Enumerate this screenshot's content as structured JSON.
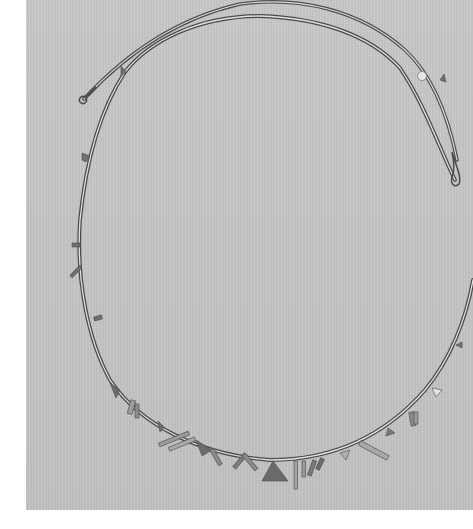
{
  "image": {
    "kind": "photograph",
    "subject": "necklace",
    "description": "Thin metal tubular-bead necklace laid in an open oval on a gray textured surface, with small triangular and bar-shaped pendant charms clustered along the lower curve; hook-and-loop clasp ends near the top left and top right.",
    "colors": {
      "background_margin": "#ffffff",
      "surface": "#c6c6c6",
      "metal": "#5a5a5a",
      "metal_highlight": "#e4e4e4",
      "charm_dark": "#6b6b6b",
      "charm_light": "#a8a8a8"
    },
    "elements": {
      "strand": "tubular bead strand",
      "clasp_left": "loop clasp end",
      "clasp_right": "hook clasp end",
      "bead_disc": "small round disc bead",
      "charms": "triangular and bar pendant charms"
    }
  }
}
